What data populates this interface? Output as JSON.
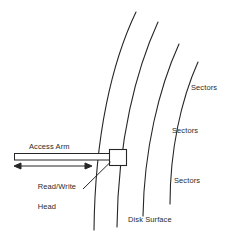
{
  "diagram": {
    "background_color": "#ffffff",
    "stroke_color": "#262626",
    "text_color": "#2b2b2b",
    "labels": {
      "access_arm": "Access Arm",
      "read_write_head_line1": "Read/Write",
      "read_write_head_line2": "Head",
      "sectors_1": "Sectors",
      "sectors_2": "Sectors",
      "sectors_3": "Sectors",
      "disk_surface": "Disk Surface"
    },
    "parts": {
      "access_arm_shape": "horizontal-bar",
      "motion_arrow": "double-headed-arrow",
      "read_write_head_shape": "rectangle",
      "leader_line": "line",
      "track_arcs_count": 4
    }
  }
}
